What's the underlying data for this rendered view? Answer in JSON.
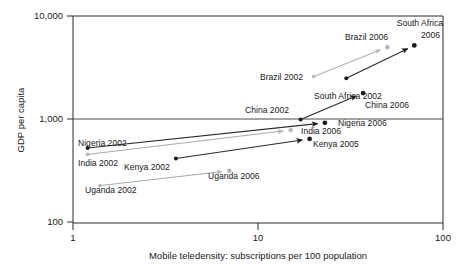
{
  "chart_data": {
    "type": "scatter",
    "title": "",
    "xlabel": "Mobile teledensity: subscriptions per 100 population",
    "ylabel": "GDP per capita",
    "xscale": "log",
    "yscale": "log",
    "xlim": [
      1,
      100
    ],
    "ylim": [
      100,
      10000
    ],
    "xticks": [
      1,
      10,
      100
    ],
    "xtick_labels": [
      "1",
      "10",
      "100"
    ],
    "yticks": [
      100,
      1000,
      10000
    ],
    "ytick_labels": [
      "100",
      "1,000",
      "10,000"
    ],
    "grid": "horizontal gridline at y = 1,000 only",
    "legend": "none",
    "annotation_note": "Arrows connect each country's earlier year point to its later year point; dark arrows/markers and light gray arrows/markers alternate by country.",
    "series": [
      {
        "name": "Nigeria",
        "style": "dark",
        "start": {
          "label": "Nigeria 2002",
          "x": 1.2,
          "y": 530
        },
        "end": {
          "label": "Nigeria 2006",
          "x": 23,
          "y": 930
        }
      },
      {
        "name": "India",
        "style": "light",
        "start": {
          "label": "India 2002",
          "x": 1.2,
          "y": 460
        },
        "end": {
          "label": "India 2006",
          "x": 15,
          "y": 790
        }
      },
      {
        "name": "Kenya",
        "style": "dark",
        "start": {
          "label": "Kenya 2002",
          "x": 3.6,
          "y": 420
        },
        "end": {
          "label": "Kenya 2005",
          "x": 19,
          "y": 650
        }
      },
      {
        "name": "Uganda",
        "style": "light",
        "start": {
          "label": "Uganda 2002",
          "x": 1.4,
          "y": 230
        },
        "end": {
          "label": "Uganda 2006",
          "x": 7.0,
          "y": 320
        }
      },
      {
        "name": "China",
        "style": "dark",
        "start": {
          "label": "China 2002",
          "x": 17,
          "y": 1000
        },
        "end": {
          "label": "China 2006",
          "x": 37,
          "y": 1800
        }
      },
      {
        "name": "Brazil",
        "style": "light",
        "start": {
          "label": "Brazil 2002",
          "x": 20,
          "y": 2600
        },
        "end": {
          "label": "Brazil 2006",
          "x": 50,
          "y": 5000
        }
      },
      {
        "name": "South Africa",
        "style": "dark",
        "start": {
          "label": "South Africa 2002",
          "x": 30,
          "y": 2500
        },
        "end": {
          "label": "South Africa 2006",
          "x": 70,
          "y": 5200
        }
      }
    ],
    "point_labels": [
      {
        "text": "South Africa",
        "x": 443,
        "y": 26,
        "anchor": "end"
      },
      {
        "text": "2006",
        "x": 440,
        "y": 38,
        "anchor": "end"
      },
      {
        "text": "Brazil 2006",
        "x": 388,
        "y": 40,
        "anchor": "end"
      },
      {
        "text": "Brazil 2002",
        "x": 303,
        "y": 80,
        "anchor": "end"
      },
      {
        "text": "South Africa 2002",
        "x": 314,
        "y": 99,
        "anchor": "start"
      },
      {
        "text": "China 2006",
        "x": 365,
        "y": 108,
        "anchor": "start"
      },
      {
        "text": "China 2002",
        "x": 289,
        "y": 113,
        "anchor": "end"
      },
      {
        "text": "Nigeria 2006",
        "x": 338,
        "y": 126,
        "anchor": "start"
      },
      {
        "text": "India 2006",
        "x": 301,
        "y": 134,
        "anchor": "start"
      },
      {
        "text": "Kenya 2005",
        "x": 313,
        "y": 147,
        "anchor": "start"
      },
      {
        "text": "Nigeria 2002",
        "x": 78,
        "y": 146,
        "anchor": "start"
      },
      {
        "text": "India 2002",
        "x": 78,
        "y": 166,
        "anchor": "start"
      },
      {
        "text": "Kenya 2002",
        "x": 124,
        "y": 170,
        "anchor": "start"
      },
      {
        "text": "Uganda 2006",
        "x": 208,
        "y": 179,
        "anchor": "start"
      },
      {
        "text": "Uganda 2002",
        "x": 85,
        "y": 193,
        "anchor": "start"
      }
    ]
  },
  "axes": {
    "x_title": "Mobile teledensity: subscriptions per 100 population",
    "y_title": "GDP per capita",
    "x_ticks": [
      "1",
      "10",
      "100"
    ],
    "y_ticks": [
      "10,000",
      "1,000",
      "100"
    ]
  },
  "colors": {
    "axis": "#2b2b2b",
    "grid": "#4a4a4a",
    "dark_marker": "#1c1c1c",
    "light_marker": "#b5b5b5",
    "background": "#ffffff"
  }
}
